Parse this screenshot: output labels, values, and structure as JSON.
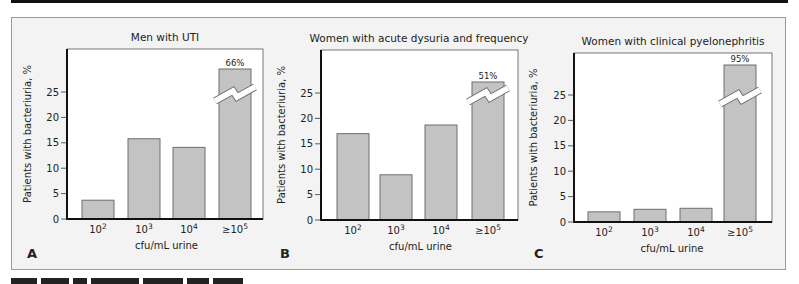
{
  "figure": {
    "background": "#f3f3f3",
    "bar_fill": "#c3c3c3",
    "bar_stroke": "#6e6e6e",
    "axis_color": "#111111",
    "break_color": "#ffffff"
  },
  "chart_data": [
    {
      "type": "bar",
      "panel": "A",
      "title": "Men with UTI",
      "xlabel": "cfu/mL urine",
      "ylabel": "Patients with bacteriuria, %",
      "categories": [
        "10^2",
        "10^3",
        "10^4",
        "≥10^5"
      ],
      "values": [
        3.7,
        15.8,
        14.1,
        66
      ],
      "value_labels": [
        null,
        null,
        null,
        "66%"
      ],
      "axis_break_on": [
        3
      ],
      "yticks": [
        0,
        5,
        10,
        15,
        20,
        25
      ],
      "ylim": [
        0,
        30
      ],
      "grid": false
    },
    {
      "type": "bar",
      "panel": "B",
      "title": "Women with acute dysuria and frequency",
      "xlabel": "cfu/mL urine",
      "ylabel": "Patients with bacteriuria, %",
      "categories": [
        "10^2",
        "10^3",
        "10^4",
        "≥10^5"
      ],
      "values": [
        17,
        8.9,
        18.7,
        51
      ],
      "value_labels": [
        null,
        null,
        null,
        "51%"
      ],
      "axis_break_on": [
        3
      ],
      "yticks": [
        0,
        5,
        10,
        15,
        20,
        25
      ],
      "ylim": [
        0,
        30
      ],
      "grid": false
    },
    {
      "type": "bar",
      "panel": "C",
      "title": "Women with clinical pyelonephritis",
      "xlabel": "cfu/mL urine",
      "ylabel": "Patients with bacteriuria, %",
      "categories": [
        "10^2",
        "10^3",
        "10^4",
        "≥10^5"
      ],
      "values": [
        2,
        2.5,
        2.7,
        95
      ],
      "value_labels": [
        null,
        null,
        null,
        "95%"
      ],
      "axis_break_on": [
        3
      ],
      "yticks": [
        0,
        5,
        10,
        15,
        20,
        25
      ],
      "ylim": [
        0,
        30
      ],
      "grid": false
    }
  ],
  "layout": [
    {
      "axis_x": 67,
      "plot_top": 49,
      "plot_right": 263,
      "baseline": 219,
      "px_per_unit": 5.08,
      "bar_x": [
        82,
        128,
        173,
        219
      ],
      "bar_w": 32,
      "break_top_y": 69,
      "title_x": 165,
      "ylabel_x": 31,
      "letter_x": 27
    },
    {
      "axis_x": 321,
      "plot_top": 50,
      "plot_right": 518,
      "baseline": 220,
      "px_per_unit": 5.08,
      "bar_x": [
        337,
        380,
        425,
        472
      ],
      "bar_w": 32,
      "break_top_y": 82,
      "title_x": 419,
      "ylabel_x": 285,
      "letter_x": 280
    },
    {
      "axis_x": 574,
      "plot_top": 53,
      "plot_right": 772,
      "baseline": 222,
      "px_per_unit": 5.08,
      "bar_x": [
        588,
        634,
        680,
        724
      ],
      "bar_w": 32,
      "break_top_y": 65,
      "title_x": 673,
      "ylabel_x": 537,
      "letter_x": 534
    }
  ]
}
